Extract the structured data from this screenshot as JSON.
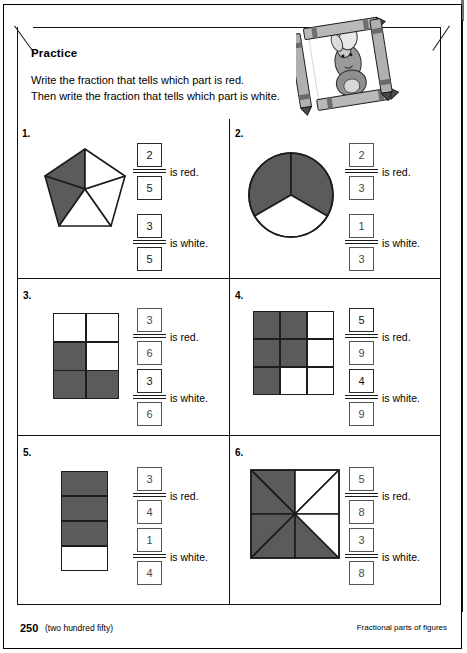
{
  "page": {
    "section_title": "Practice",
    "instructions_line1": "Write the fraction that tells which part is red.",
    "instructions_line2": "Then write the fraction that tells which part is white.",
    "illustration_name": "rabbit-with-crayons-frame",
    "footer": {
      "page_number": "250",
      "page_number_words": "(two hundred fifty)",
      "topic": "Fractional parts of figures"
    }
  },
  "labels": {
    "is_red": "is red.",
    "is_white": "is white."
  },
  "colors": {
    "shaded_fill": "#5b5b5b",
    "unshaded_fill": "#ffffff",
    "outline": "#1c1c1c",
    "answer_text": "#4a4a4a",
    "answer_text_dark": "#161616"
  },
  "problems": [
    {
      "number": "1.",
      "figure": {
        "type": "pentagon-sectors",
        "total_parts": 5,
        "shaded_parts": 2,
        "shaded_indices": [
          0,
          1
        ]
      },
      "red_fraction": {
        "numerator": "2",
        "denominator": "5"
      },
      "white_fraction": {
        "numerator": "3",
        "denominator": "5"
      }
    },
    {
      "number": "2.",
      "figure": {
        "type": "circle-sectors",
        "total_parts": 3,
        "shaded_parts": 2,
        "shaded_indices": [
          0,
          1
        ]
      },
      "red_fraction": {
        "numerator": "2",
        "denominator": "3"
      },
      "white_fraction": {
        "numerator": "1",
        "denominator": "3"
      }
    },
    {
      "number": "3.",
      "figure": {
        "type": "rect-grid",
        "columns": 2,
        "rows": 3,
        "total_parts": 6,
        "shaded_parts": 3,
        "shaded_cells": [
          2,
          4,
          5
        ]
      },
      "red_fraction": {
        "numerator": "3",
        "denominator": "6"
      },
      "white_fraction": {
        "numerator": "3",
        "denominator": "6"
      }
    },
    {
      "number": "4.",
      "figure": {
        "type": "rect-grid",
        "columns": 3,
        "rows": 3,
        "total_parts": 9,
        "shaded_parts": 5,
        "shaded_cells": [
          0,
          1,
          3,
          4,
          6
        ]
      },
      "red_fraction": {
        "numerator": "5",
        "denominator": "9"
      },
      "white_fraction": {
        "numerator": "4",
        "denominator": "9"
      }
    },
    {
      "number": "5.",
      "figure": {
        "type": "rect-grid",
        "columns": 1,
        "rows": 4,
        "total_parts": 4,
        "shaded_parts": 3,
        "shaded_cells": [
          0,
          1,
          2
        ]
      },
      "red_fraction": {
        "numerator": "3",
        "denominator": "4"
      },
      "white_fraction": {
        "numerator": "1",
        "denominator": "4"
      }
    },
    {
      "number": "6.",
      "figure": {
        "type": "square-eighths-triangles",
        "total_parts": 8,
        "shaded_parts": 5,
        "shaded_indices": [
          0,
          1,
          4,
          5,
          6
        ]
      },
      "red_fraction": {
        "numerator": "5",
        "denominator": "8"
      },
      "white_fraction": {
        "numerator": "3",
        "denominator": "8"
      }
    }
  ]
}
